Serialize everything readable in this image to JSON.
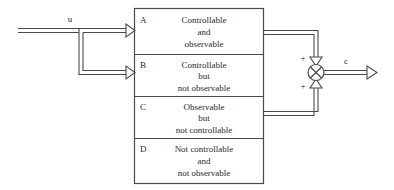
{
  "diagram": {
    "background_color": "#ffffff",
    "line_color": "#4a4a4a",
    "text_color": "#2b2b2b",
    "signals": {
      "input_label": "u",
      "output_label": "c"
    },
    "summing_junction": {
      "type": "cross-circle",
      "sign_top": "+",
      "sign_bottom": "+"
    },
    "blocks": [
      {
        "id": "A",
        "letter": "A",
        "lines": [
          "Controllable",
          "and",
          "observable"
        ],
        "has_input": true,
        "has_output": true
      },
      {
        "id": "B",
        "letter": "B",
        "lines": [
          "Controllable",
          "but",
          "not observable"
        ],
        "has_input": true,
        "has_output": false
      },
      {
        "id": "C",
        "letter": "C",
        "lines": [
          "Observable",
          "but",
          "not controllable"
        ],
        "has_input": false,
        "has_output": true
      },
      {
        "id": "D",
        "letter": "D",
        "lines": [
          "Not controllable",
          "and",
          "not observable"
        ],
        "has_input": false,
        "has_output": false
      }
    ]
  }
}
